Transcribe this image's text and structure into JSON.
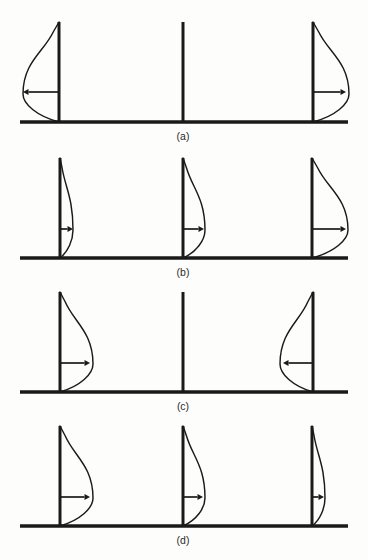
{
  "figure": {
    "background_color": "#fdfdfc",
    "ink_color": "#1a1a1a",
    "panel_count": 4,
    "stations_per_panel": 3
  },
  "chart_data": {
    "type": "line",
    "subtitle": "",
    "xlabel": "",
    "ylabel": "",
    "grid": false,
    "legend": "none",
    "panels": [
      {
        "label": "(a)",
        "label_x": 183,
        "baseline_y": 122,
        "baseline_x0": 20,
        "baseline_x1": 348,
        "line_top_y": 22,
        "stations": [
          {
            "name": "station-left",
            "x": 59,
            "profile": "left",
            "amplitude": 36,
            "arrow": "left",
            "arrow_length": 36,
            "arrow_y": 92
          },
          {
            "name": "station-middle",
            "x": 183,
            "profile": "none",
            "amplitude": 0,
            "arrow": "none",
            "arrow_length": 0,
            "arrow_y": 92
          },
          {
            "name": "station-right",
            "x": 313,
            "profile": "right",
            "amplitude": 36,
            "arrow": "right",
            "arrow_length": 33,
            "arrow_y": 92
          }
        ]
      },
      {
        "label": "(b)",
        "label_x": 183,
        "baseline_y": 258,
        "baseline_x0": 20,
        "baseline_x1": 348,
        "line_top_y": 158,
        "stations": [
          {
            "name": "station-left",
            "x": 60,
            "profile": "right",
            "amplitude": 13,
            "arrow": "right",
            "arrow_length": 13,
            "arrow_y": 229
          },
          {
            "name": "station-middle",
            "x": 183,
            "profile": "right",
            "amplitude": 22,
            "arrow": "right",
            "arrow_length": 21,
            "arrow_y": 229
          },
          {
            "name": "station-right",
            "x": 312,
            "profile": "right",
            "amplitude": 36,
            "arrow": "right",
            "arrow_length": 34,
            "arrow_y": 229
          }
        ]
      },
      {
        "label": "(c)",
        "label_x": 183,
        "baseline_y": 392,
        "baseline_x0": 20,
        "baseline_x1": 348,
        "line_top_y": 292,
        "stations": [
          {
            "name": "station-left",
            "x": 60,
            "profile": "right",
            "amplitude": 33,
            "arrow": "right",
            "arrow_length": 30,
            "arrow_y": 363
          },
          {
            "name": "station-middle",
            "x": 183,
            "profile": "none",
            "amplitude": 0,
            "arrow": "none",
            "arrow_length": 0,
            "arrow_y": 363
          },
          {
            "name": "station-right",
            "x": 313,
            "profile": "left",
            "amplitude": 33,
            "arrow": "left",
            "arrow_length": 30,
            "arrow_y": 363
          }
        ]
      },
      {
        "label": "(d)",
        "label_x": 183,
        "baseline_y": 526,
        "baseline_x0": 20,
        "baseline_x1": 348,
        "line_top_y": 426,
        "stations": [
          {
            "name": "station-left",
            "x": 60,
            "profile": "right",
            "amplitude": 33,
            "arrow": "right",
            "arrow_length": 30,
            "arrow_y": 497
          },
          {
            "name": "station-middle",
            "x": 183,
            "profile": "right",
            "amplitude": 22,
            "arrow": "right",
            "arrow_length": 20,
            "arrow_y": 497
          },
          {
            "name": "station-right",
            "x": 312,
            "profile": "right",
            "amplitude": 13,
            "arrow": "right",
            "arrow_length": 12,
            "arrow_y": 497
          }
        ]
      }
    ]
  }
}
